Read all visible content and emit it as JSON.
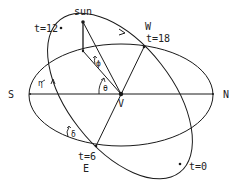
{
  "diagram": {
    "labels": {
      "sun": "sun",
      "t12": "t=12",
      "t18": "t=18",
      "t6": "t=6",
      "t0": "t=0",
      "west": "W",
      "east": "E",
      "south": "S",
      "north": "N",
      "vertex": "V",
      "theta": "θ",
      "phi": "ϕ",
      "eta": "η",
      "delta": "δ"
    },
    "stroke_color": "#1a1a1a",
    "background": "#ffffff"
  }
}
